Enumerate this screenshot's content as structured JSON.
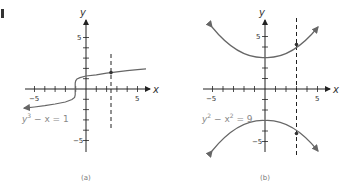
{
  "figure": {
    "corner_mark": "1",
    "panels": [
      {
        "caption": "(a)",
        "equation_text": "y³ − x = 1",
        "equation_parts": {
          "base1": "y",
          "exp1": "3",
          "rest": " − x = 1"
        },
        "x_axis_label": "x",
        "y_axis_label": "y",
        "x_ticks": {
          "neg5": "−5",
          "pos5": "5"
        },
        "y_ticks": {
          "pos5": "5",
          "neg5": "−5"
        },
        "dashed_line_x": 3,
        "highlight_point": [
          3,
          1.587
        ]
      },
      {
        "caption": "(b)",
        "equation_text": "y² − x² = 9",
        "equation_parts": {
          "base1": "y",
          "exp1": "2",
          "mid": " − x",
          "exp2": "2",
          "rest": " = 9"
        },
        "x_axis_label": "x",
        "y_axis_label": "y",
        "x_ticks": {
          "neg5": "−5",
          "pos5": "5"
        },
        "y_ticks": {
          "pos5": "5",
          "neg5": "−5"
        },
        "dashed_line_x": 3,
        "highlight_points": [
          [
            3,
            4.243
          ],
          [
            3,
            -4.243
          ]
        ]
      }
    ],
    "colors": {
      "curve": "#666666",
      "axis": "#222222",
      "equation": "#888888",
      "caption": "#777777"
    }
  }
}
